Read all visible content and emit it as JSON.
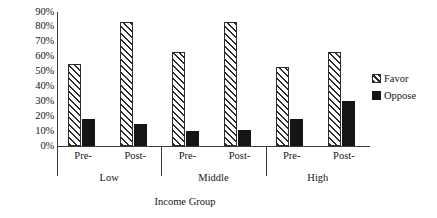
{
  "chart_data": {
    "type": "bar",
    "title": "",
    "xlabel": "Income Group",
    "ylabel": "",
    "ylim": [
      0,
      90
    ],
    "ytick_labels": [
      "90%",
      "80%",
      "70%",
      "60%",
      "50%",
      "40%",
      "30%",
      "20%",
      "10%",
      "0%"
    ],
    "ytick_values": [
      90,
      80,
      70,
      60,
      50,
      40,
      30,
      20,
      10,
      0
    ],
    "grid": false,
    "legend_position": "right",
    "categories": [
      "Pre-",
      "Post-",
      "Pre-",
      "Post-",
      "Pre-",
      "Post-"
    ],
    "groups": [
      {
        "label": "Low",
        "categories": [
          "Pre-",
          "Post-"
        ]
      },
      {
        "label": "Middle",
        "categories": [
          "Pre-",
          "Post-"
        ]
      },
      {
        "label": "High",
        "categories": [
          "Pre-",
          "Post-"
        ]
      }
    ],
    "series": [
      {
        "name": "Favor",
        "pattern": "diagonal-hatch",
        "color": "#2b2b2b",
        "values": [
          55,
          83,
          63,
          83,
          53,
          63
        ]
      },
      {
        "name": "Oppose",
        "pattern": "solid",
        "color": "#151515",
        "values": [
          18,
          15,
          10,
          11,
          18,
          30
        ]
      }
    ]
  },
  "legend": {
    "items": [
      {
        "label": "Favor",
        "swatch": "hatch-swatch"
      },
      {
        "label": "Oppose",
        "swatch": "solid-swatch"
      }
    ]
  },
  "axis": {
    "x_title": "Income Group"
  }
}
